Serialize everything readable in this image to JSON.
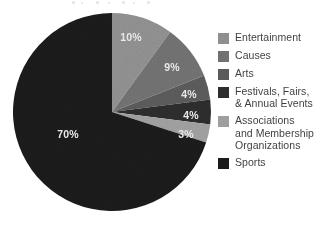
{
  "chart_data": {
    "type": "pie",
    "title": "",
    "subtitle": "",
    "xlabel": "",
    "ylabel": "",
    "grid": false,
    "legend_position": "right",
    "start_angle_deg": 0,
    "direction": "clockwise",
    "center": {
      "x": 112,
      "y": 112
    },
    "radius": 99,
    "categories": [
      "Entertainment",
      "Causes",
      "Arts",
      "Festivals, Fairs, & Annual Events",
      "Associations and Membership Organizations",
      "Sports"
    ],
    "values": [
      10,
      9,
      4,
      4,
      3,
      70
    ],
    "value_labels": [
      "10%",
      "9%",
      "4%",
      "4%",
      "3%",
      "70%"
    ],
    "colors": [
      "#8b8b8b",
      "#6d6d6d",
      "#575757",
      "#2b2b2b",
      "#9b9b9b",
      "#1a1a1a"
    ],
    "slices": [
      {
        "name": "Entertainment",
        "value": 10,
        "label": "10%",
        "color": "#8b8b8b",
        "label_x": 131,
        "label_y": 38
      },
      {
        "name": "Causes",
        "value": 9,
        "label": "9%",
        "color": "#6d6d6d",
        "label_x": 172,
        "label_y": 68
      },
      {
        "name": "Arts",
        "value": 4,
        "label": "4%",
        "color": "#575757",
        "label_x": 189,
        "label_y": 95
      },
      {
        "name": "Festivals, Fairs, & Annual Events",
        "value": 4,
        "label": "4%",
        "color": "#2b2b2b",
        "label_x": 191,
        "label_y": 116
      },
      {
        "name": "Associations and Membership Organizations",
        "value": 3,
        "label": "3%",
        "color": "#9b9b9b",
        "label_x": 186,
        "label_y": 135
      },
      {
        "name": "Sports",
        "value": 70,
        "label": "70%",
        "color": "#1a1a1a",
        "label_x": 68,
        "label_y": 135
      }
    ]
  },
  "legend": {
    "items": [
      {
        "label": "Entertainment",
        "color": "#8b8b8b"
      },
      {
        "label": "Causes",
        "color": "#6d6d6d"
      },
      {
        "label": "Arts",
        "color": "#575757"
      },
      {
        "label": "Festivals, Fairs,\n& Annual Events",
        "color": "#2b2b2b"
      },
      {
        "label": "Associations\nand Membership\nOrganizations",
        "color": "#9b9b9b"
      },
      {
        "label": "Sports",
        "color": "#1a1a1a"
      }
    ]
  },
  "theme": {
    "background": "#ffffff",
    "label_text_color": "#e8e8e8",
    "legend_text_color": "#3b3b3b"
  }
}
